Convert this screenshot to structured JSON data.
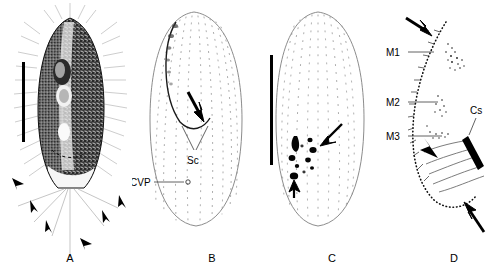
{
  "figure": {
    "background_color": "#ffffff",
    "ink_color": "#000000",
    "outline_color": "#8c8c8c",
    "panels": [
      {
        "id": "A",
        "label": "A",
        "caption_label": "A",
        "type": "photomicrograph",
        "description": "ventral view of live cell with caudal cilia",
        "scale_bar": {
          "present": true,
          "orientation": "vertical"
        },
        "arrowhead_count": 6,
        "annotations": []
      },
      {
        "id": "B",
        "label": "B",
        "caption_label": "B",
        "type": "line-drawing",
        "description": "ventral infraciliature showing ciliary rows",
        "scale_bar": {
          "present": false,
          "orientation": "vertical"
        },
        "arrow_count": 1,
        "annotations": [
          {
            "name": "Sc",
            "text": "Sc",
            "leader": "v-shaped"
          },
          {
            "name": "CVP",
            "text": "CVP",
            "leader": "horizontal"
          }
        ]
      },
      {
        "id": "C",
        "label": "C",
        "caption_label": "C",
        "type": "line-drawing",
        "description": "dorsal infraciliature with macronuclear nodules",
        "scale_bar": {
          "present": true,
          "orientation": "vertical"
        },
        "arrow_count": 2,
        "annotations": []
      },
      {
        "id": "D",
        "label": "D",
        "caption_label": "D",
        "type": "line-drawing",
        "description": "detail of oral apparatus and membranelles",
        "scale_bar": {
          "present": false,
          "orientation": "vertical"
        },
        "arrow_count": 3,
        "annotations": [
          {
            "name": "M1",
            "text": "M1",
            "leader": "horizontal"
          },
          {
            "name": "M2",
            "text": "M2",
            "leader": "horizontal"
          },
          {
            "name": "M3",
            "text": "M3",
            "leader": "horizontal"
          },
          {
            "name": "Cs",
            "text": "Cs",
            "leader": "diagonal"
          }
        ]
      }
    ]
  }
}
